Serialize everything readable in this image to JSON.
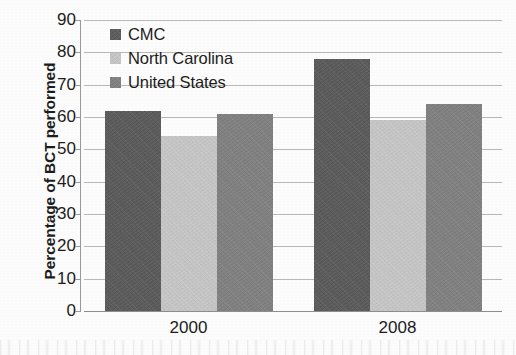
{
  "chart_data": {
    "type": "bar",
    "title": "",
    "xlabel": "",
    "ylabel": "Percentage of BCT performed",
    "categories": [
      "2000",
      "2008"
    ],
    "series": [
      {
        "name": "CMC",
        "values": [
          62,
          78
        ],
        "color": "#595959"
      },
      {
        "name": "North Carolina",
        "values": [
          54,
          59
        ],
        "color": "#c9c9c9"
      },
      {
        "name": "United States",
        "values": [
          61,
          64
        ],
        "color": "#808080"
      }
    ],
    "ylim": [
      0,
      90
    ],
    "ytick_step": 10,
    "yticks": [
      "0",
      "10",
      "20",
      "30",
      "40",
      "50",
      "60",
      "70",
      "80",
      "90"
    ],
    "grid": true,
    "legend_position": "top-left"
  },
  "legend": {
    "items": [
      {
        "label": "CMC"
      },
      {
        "label": "North Carolina"
      },
      {
        "label": "United States"
      }
    ]
  },
  "axis": {
    "y_title": "Percentage of BCT performed",
    "x_tick_labels": [
      "2000",
      "2008"
    ]
  }
}
